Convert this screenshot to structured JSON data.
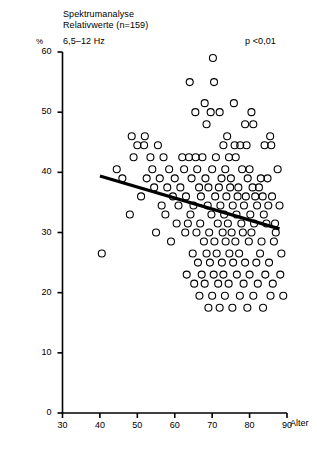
{
  "header": {
    "title_line1": "Spektrumanalyse",
    "title_line2": "Relativwerte (n=159)",
    "title_line3": "6,5–12 Hz",
    "significance": "p <0,01"
  },
  "axes": {
    "y_unit": "%",
    "x_axis_label": "Alter",
    "y_ticks": [
      "0",
      "10",
      "20",
      "30",
      "40",
      "50",
      "60"
    ],
    "x_ticks": [
      "30",
      "40",
      "50",
      "60",
      "70",
      "80",
      "90"
    ]
  },
  "chart_data": {
    "type": "scatter",
    "title": "Spektrumanalyse Relativwerte (n=159) 6,5–12 Hz",
    "xlabel": "Alter",
    "ylabel": "%",
    "xlim": [
      30,
      90
    ],
    "ylim": [
      0,
      60
    ],
    "xticks": [
      30,
      40,
      50,
      60,
      70,
      80,
      90
    ],
    "yticks": [
      0,
      10,
      20,
      30,
      40,
      50,
      60
    ],
    "grid": false,
    "legend": null,
    "annotations": [
      {
        "text": "p <0,01",
        "x": 82,
        "y": 57
      }
    ],
    "marker": {
      "style": "open-circle",
      "color": "#000000",
      "size": 7
    },
    "n": 159,
    "points": [
      [
        70.2,
        59.0
      ],
      [
        64.0,
        55.0
      ],
      [
        70.5,
        55.0
      ],
      [
        68.0,
        51.5
      ],
      [
        75.8,
        51.5
      ],
      [
        65.5,
        50.0
      ],
      [
        69.6,
        50.0
      ],
      [
        72.0,
        50.0
      ],
      [
        80.5,
        50.0
      ],
      [
        68.5,
        48.0
      ],
      [
        78.8,
        48.0
      ],
      [
        81.0,
        48.0
      ],
      [
        48.5,
        46.0
      ],
      [
        52.0,
        46.0
      ],
      [
        74.0,
        46.0
      ],
      [
        85.5,
        46.0
      ],
      [
        50.0,
        44.5
      ],
      [
        51.8,
        44.5
      ],
      [
        55.5,
        44.5
      ],
      [
        73.0,
        44.5
      ],
      [
        76.0,
        44.5
      ],
      [
        77.5,
        44.5
      ],
      [
        79.2,
        44.5
      ],
      [
        84.0,
        44.5
      ],
      [
        85.8,
        44.5
      ],
      [
        49.0,
        42.5
      ],
      [
        53.5,
        42.5
      ],
      [
        57.0,
        42.5
      ],
      [
        62.0,
        42.5
      ],
      [
        63.8,
        42.5
      ],
      [
        65.6,
        42.5
      ],
      [
        67.4,
        42.5
      ],
      [
        71.0,
        42.5
      ],
      [
        74.5,
        42.5
      ],
      [
        76.3,
        42.5
      ],
      [
        44.5,
        40.5
      ],
      [
        54.0,
        40.5
      ],
      [
        58.5,
        40.5
      ],
      [
        62.5,
        40.5
      ],
      [
        66.0,
        40.5
      ],
      [
        70.0,
        40.5
      ],
      [
        73.5,
        40.5
      ],
      [
        78.0,
        40.5
      ],
      [
        80.0,
        40.5
      ],
      [
        87.5,
        40.5
      ],
      [
        46.0,
        39.0
      ],
      [
        52.5,
        39.0
      ],
      [
        56.0,
        39.0
      ],
      [
        60.0,
        39.0
      ],
      [
        64.5,
        39.0
      ],
      [
        68.2,
        39.0
      ],
      [
        72.5,
        39.0
      ],
      [
        75.0,
        39.0
      ],
      [
        79.5,
        39.0
      ],
      [
        83.0,
        39.0
      ],
      [
        84.8,
        39.0
      ],
      [
        54.5,
        37.5
      ],
      [
        58.0,
        37.5
      ],
      [
        61.5,
        37.5
      ],
      [
        66.5,
        37.5
      ],
      [
        69.0,
        37.5
      ],
      [
        71.8,
        37.5
      ],
      [
        74.8,
        37.5
      ],
      [
        77.0,
        37.5
      ],
      [
        80.8,
        37.5
      ],
      [
        82.5,
        37.5
      ],
      [
        51.0,
        36.0
      ],
      [
        59.5,
        36.0
      ],
      [
        63.0,
        36.0
      ],
      [
        67.0,
        36.0
      ],
      [
        70.8,
        36.0
      ],
      [
        73.8,
        36.0
      ],
      [
        76.8,
        36.0
      ],
      [
        79.0,
        36.0
      ],
      [
        81.5,
        36.0
      ],
      [
        83.5,
        36.0
      ],
      [
        86.0,
        36.0
      ],
      [
        56.5,
        34.5
      ],
      [
        61.0,
        34.5
      ],
      [
        65.0,
        34.5
      ],
      [
        68.8,
        34.5
      ],
      [
        72.2,
        34.5
      ],
      [
        75.5,
        34.5
      ],
      [
        78.5,
        34.5
      ],
      [
        82.0,
        34.5
      ],
      [
        85.0,
        34.5
      ],
      [
        88.0,
        34.5
      ],
      [
        48.0,
        33.0
      ],
      [
        57.5,
        33.0
      ],
      [
        64.2,
        33.0
      ],
      [
        69.8,
        33.0
      ],
      [
        73.2,
        33.0
      ],
      [
        76.5,
        33.0
      ],
      [
        80.2,
        33.0
      ],
      [
        83.8,
        33.0
      ],
      [
        60.5,
        31.5
      ],
      [
        63.5,
        31.5
      ],
      [
        66.8,
        31.5
      ],
      [
        71.5,
        31.5
      ],
      [
        74.2,
        31.5
      ],
      [
        77.8,
        31.5
      ],
      [
        81.2,
        31.5
      ],
      [
        84.5,
        31.5
      ],
      [
        86.8,
        31.5
      ],
      [
        55.0,
        30.0
      ],
      [
        62.8,
        30.0
      ],
      [
        65.8,
        30.0
      ],
      [
        69.2,
        30.0
      ],
      [
        72.8,
        30.0
      ],
      [
        75.2,
        30.0
      ],
      [
        78.2,
        30.0
      ],
      [
        80.5,
        30.0
      ],
      [
        87.0,
        30.0
      ],
      [
        59.0,
        28.5
      ],
      [
        67.8,
        28.5
      ],
      [
        70.6,
        28.5
      ],
      [
        73.6,
        28.5
      ],
      [
        76.2,
        28.5
      ],
      [
        79.8,
        28.5
      ],
      [
        83.2,
        28.5
      ],
      [
        86.5,
        28.5
      ],
      [
        40.5,
        26.5
      ],
      [
        64.8,
        26.5
      ],
      [
        68.5,
        26.5
      ],
      [
        71.2,
        26.5
      ],
      [
        74.6,
        26.5
      ],
      [
        77.2,
        26.5
      ],
      [
        82.8,
        26.5
      ],
      [
        88.5,
        26.5
      ],
      [
        66.2,
        25.0
      ],
      [
        69.4,
        25.0
      ],
      [
        72.6,
        25.0
      ],
      [
        75.6,
        25.0
      ],
      [
        78.8,
        25.0
      ],
      [
        81.8,
        25.0
      ],
      [
        85.2,
        25.0
      ],
      [
        63.2,
        23.0
      ],
      [
        67.2,
        23.0
      ],
      [
        70.4,
        23.0
      ],
      [
        73.0,
        23.0
      ],
      [
        76.6,
        23.0
      ],
      [
        80.0,
        23.0
      ],
      [
        84.2,
        23.0
      ],
      [
        88.2,
        23.0
      ],
      [
        65.2,
        21.5
      ],
      [
        68.0,
        21.5
      ],
      [
        71.6,
        21.5
      ],
      [
        74.4,
        21.5
      ],
      [
        78.4,
        21.5
      ],
      [
        82.2,
        21.5
      ],
      [
        86.2,
        21.5
      ],
      [
        66.6,
        19.5
      ],
      [
        70.0,
        19.5
      ],
      [
        73.4,
        19.5
      ],
      [
        77.4,
        19.5
      ],
      [
        81.0,
        19.5
      ],
      [
        85.6,
        19.5
      ],
      [
        89.0,
        19.5
      ],
      [
        69.0,
        17.5
      ],
      [
        72.0,
        17.5
      ],
      [
        75.4,
        17.5
      ],
      [
        79.4,
        17.5
      ],
      [
        83.6,
        17.5
      ]
    ],
    "regression_line": {
      "x_start": 40,
      "y_start": 39.4,
      "x_end": 88,
      "y_end": 30.6,
      "color": "#000000",
      "width": 3.2
    }
  }
}
